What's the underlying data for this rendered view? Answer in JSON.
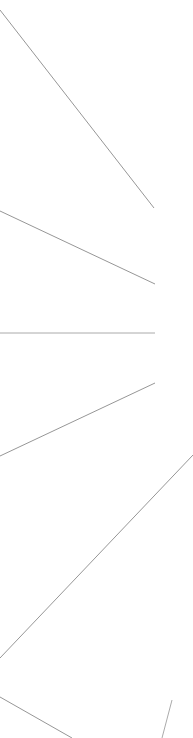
{
  "canvas": {
    "width": 193,
    "height": 738,
    "background_color": "#ffffff",
    "description": "Sparse line diagram of thin gray rays fanning out from points along the left edge"
  },
  "style": {
    "stroke_color": "#8a8a8a",
    "stroke_color_light": "#a9a9a9",
    "stroke_width": 0.9
  },
  "chart_data": {
    "type": "line",
    "title": "",
    "xlabel": "",
    "ylabel": "",
    "xlim": [
      0,
      193
    ],
    "ylim": [
      0,
      738
    ],
    "grid": false,
    "legend": "none",
    "axis_of_symmetry_y": 333,
    "series": [
      {
        "name": "ray-1-upper-steep",
        "x": [
          0,
          154
        ],
        "y": [
          10,
          208
        ],
        "color": "#8a8a8a"
      },
      {
        "name": "ray-2-upper-shallow",
        "x": [
          0,
          155
        ],
        "y": [
          211,
          284
        ],
        "color": "#8a8a8a"
      },
      {
        "name": "ray-3-horizontal",
        "x": [
          0,
          155
        ],
        "y": [
          333,
          333
        ],
        "color": "#a0a0a0"
      },
      {
        "name": "ray-4-lower-shallow",
        "x": [
          0,
          155
        ],
        "y": [
          456,
          383
        ],
        "color": "#8a8a8a"
      },
      {
        "name": "ray-5-lower-steep",
        "x": [
          0,
          193
        ],
        "y": [
          658,
          455
        ],
        "color": "#8a8a8a"
      },
      {
        "name": "ray-6-bottom-descending",
        "x": [
          0,
          72
        ],
        "y": [
          697,
          738
        ],
        "color": "#8a8a8a"
      },
      {
        "name": "ray-7-bottom-right-steep",
        "x": [
          172,
          162
        ],
        "y": [
          700,
          738
        ],
        "color": "#a0a0a0"
      }
    ]
  }
}
